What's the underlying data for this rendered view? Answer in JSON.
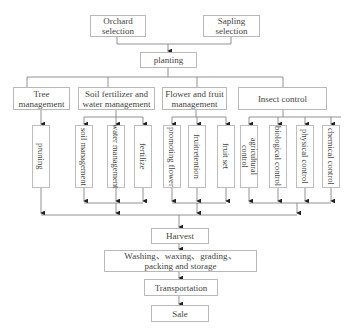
{
  "diagram": {
    "top_sources": [
      {
        "label": "Orchard selection",
        "line1": "Orchard",
        "line2": "selection"
      },
      {
        "label": "Sapling selection",
        "line1": "Sapling",
        "line2": "selection"
      }
    ],
    "planting": "planting",
    "categories": [
      {
        "label": "Tree management",
        "line1": "Tree",
        "line2": "management",
        "items": [
          "pruning"
        ]
      },
      {
        "label": "Soil fertilizer and water management",
        "line1": "Soil fertilizer and",
        "line2": "water management",
        "items": [
          "soil management",
          "water management",
          "fertilize"
        ]
      },
      {
        "label": "Flower and fruit management",
        "line1": "Flower and fruit",
        "line2": "management",
        "items": [
          "promoting flower",
          "fruitretention",
          "fruit set"
        ]
      },
      {
        "label": "Insect control",
        "line1": "Insect control",
        "line2": "",
        "items": [
          "agricultural control",
          "biological control",
          "physical control",
          "chemical control"
        ]
      }
    ],
    "agri_line1": "agricultural",
    "agri_line2": "control",
    "pipeline": {
      "harvest": "Harvest",
      "washing_line1": "Washing、waxing、grading、",
      "washing_line2": "packing and storage",
      "transportation": "Transportation",
      "sale": "Sale"
    },
    "colors": {
      "line": "#555555",
      "border": "#b8b8b8",
      "text": "#444444"
    }
  }
}
